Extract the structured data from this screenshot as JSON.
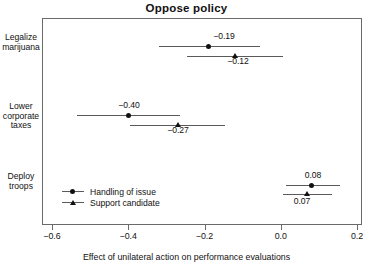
{
  "chart_data": {
    "type": "scatter",
    "title": "Oppose policy",
    "xlabel": "Effect of unilateral action on performance evaluations",
    "ylabel": "",
    "xlim": [
      -0.6,
      0.2
    ],
    "xticks": [
      -0.6,
      -0.4,
      -0.2,
      0.0,
      0.2
    ],
    "xticklabels": [
      "-0.6",
      "-0.4",
      "-0.2",
      "0.0",
      "0.2"
    ],
    "grid": false,
    "legend_position": "bottom-left",
    "categories": [
      "Legalize marijuana",
      "Lower corporate taxes",
      "Deploy troops"
    ],
    "series": [
      {
        "name": "Handling of issue",
        "marker": "circle",
        "values": [
          -0.19,
          -0.4,
          0.08
        ],
        "labels": [
          "-0.19",
          "-0.40",
          "0.08"
        ],
        "ci_low": [
          -0.32,
          -0.535,
          0.015
        ],
        "ci_high": [
          -0.055,
          -0.265,
          0.155
        ]
      },
      {
        "name": "Support candidate",
        "marker": "triangle",
        "values": [
          -0.12,
          -0.27,
          0.07
        ],
        "labels": [
          "-0.12",
          "-0.27",
          "0.07"
        ],
        "ci_low": [
          -0.245,
          -0.395,
          0.005
        ],
        "ci_high": [
          0.005,
          -0.145,
          0.135
        ]
      }
    ]
  },
  "axis": {
    "category_labels": [
      [
        "Legalize",
        "marijuana"
      ],
      [
        "Lower",
        "corporate",
        "taxes"
      ],
      [
        "Deploy",
        "troops"
      ]
    ]
  },
  "legend": {
    "items": [
      {
        "label": "Handling of issue",
        "marker": "circle"
      },
      {
        "label": "Support candidate",
        "marker": "triangle"
      }
    ]
  }
}
